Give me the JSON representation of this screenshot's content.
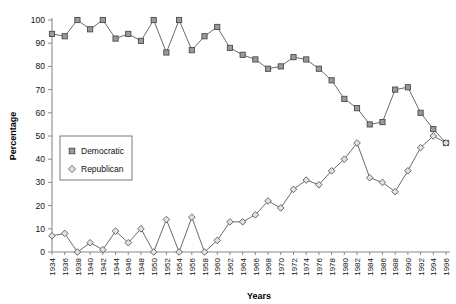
{
  "chart_data": {
    "type": "line",
    "title": "",
    "xlabel": "Years",
    "ylabel": "Percentage",
    "ylim": [
      0,
      100
    ],
    "ytick_step": 10,
    "yticks": [
      0,
      10,
      20,
      30,
      40,
      50,
      60,
      70,
      80,
      90,
      100
    ],
    "grid": false,
    "legend_position": "inner-left",
    "categories": [
      "1934",
      "1936",
      "1938",
      "1940",
      "1942",
      "1944",
      "1946",
      "1948",
      "1950",
      "1952",
      "1954",
      "1956",
      "1958",
      "1960",
      "1962",
      "1964",
      "1966",
      "1968",
      "1970",
      "1972",
      "1974",
      "1976",
      "1978",
      "1980",
      "1982",
      "1984",
      "1986",
      "1988",
      "1990",
      "1992",
      "1994",
      "1996"
    ],
    "series": [
      {
        "name": "Democratic",
        "marker": "square",
        "values": [
          94,
          93,
          100,
          96,
          100,
          92,
          94,
          91,
          100,
          86,
          100,
          87,
          93,
          97,
          88,
          85,
          83,
          79,
          80,
          84,
          83,
          79,
          74,
          66,
          62,
          55,
          56,
          70,
          71,
          60,
          53,
          47
        ]
      },
      {
        "name": "Republican",
        "marker": "diamond",
        "values": [
          7,
          8,
          0,
          4,
          1,
          9,
          4,
          10,
          0,
          14,
          0,
          15,
          0,
          5,
          13,
          13,
          16,
          22,
          19,
          27,
          31,
          29,
          35,
          40,
          47,
          32,
          30,
          26,
          35,
          45,
          50,
          47
        ]
      }
    ],
    "legend_entries": [
      "Democratic",
      "Republican"
    ]
  },
  "layout": {
    "plot": {
      "left": 52,
      "right": 446,
      "top": 20,
      "bottom": 252
    },
    "colors": {
      "democratic_marker_fill": "#9a9a9a",
      "republican_marker_fill": "#e2e2e2",
      "line": "#6b6b6b",
      "axis": "#8a8a8a",
      "text": "#111111",
      "background": "#ffffff"
    }
  }
}
